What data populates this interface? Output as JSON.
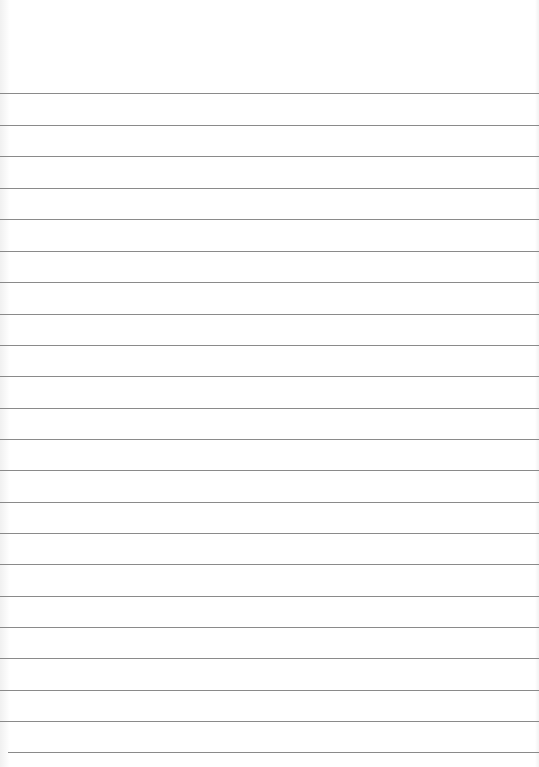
{
  "sheet": {
    "type": "lined-paper",
    "background_color": "#ffffff",
    "rule_color": "#8a8a8a",
    "rule_thickness": 1,
    "rules": [
      {
        "y": 93,
        "x_start": 0,
        "x_end": 539
      },
      {
        "y": 125,
        "x_start": 0,
        "x_end": 539
      },
      {
        "y": 156,
        "x_start": 0,
        "x_end": 539
      },
      {
        "y": 188,
        "x_start": 0,
        "x_end": 539
      },
      {
        "y": 219,
        "x_start": 0,
        "x_end": 539
      },
      {
        "y": 251,
        "x_start": 0,
        "x_end": 539
      },
      {
        "y": 282,
        "x_start": 0,
        "x_end": 539
      },
      {
        "y": 314,
        "x_start": 0,
        "x_end": 539
      },
      {
        "y": 345,
        "x_start": 0,
        "x_end": 539
      },
      {
        "y": 376,
        "x_start": 0,
        "x_end": 539
      },
      {
        "y": 408,
        "x_start": 0,
        "x_end": 539
      },
      {
        "y": 439,
        "x_start": 0,
        "x_end": 539
      },
      {
        "y": 470,
        "x_start": 0,
        "x_end": 539
      },
      {
        "y": 502,
        "x_start": 0,
        "x_end": 539
      },
      {
        "y": 533,
        "x_start": 0,
        "x_end": 539
      },
      {
        "y": 564,
        "x_start": 0,
        "x_end": 539
      },
      {
        "y": 596,
        "x_start": 0,
        "x_end": 539
      },
      {
        "y": 627,
        "x_start": 0,
        "x_end": 539
      },
      {
        "y": 658,
        "x_start": 0,
        "x_end": 539
      },
      {
        "y": 690,
        "x_start": 0,
        "x_end": 539
      },
      {
        "y": 721,
        "x_start": 0,
        "x_end": 539
      },
      {
        "y": 752,
        "x_start": 8,
        "x_end": 539
      }
    ],
    "text_content": []
  }
}
